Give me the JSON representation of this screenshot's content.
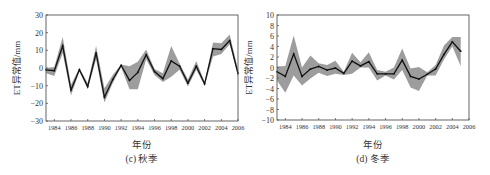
{
  "chart_data": [
    {
      "id": "c",
      "type": "line",
      "title": "(c) 秋季",
      "xlabel": "年份",
      "ylabel": "ET异常值/mm",
      "ylim": [
        -30,
        30
      ],
      "xlim": [
        1983,
        2006
      ],
      "yticks": [
        -30,
        -20,
        -10,
        0,
        10,
        20,
        30
      ],
      "xticks": [
        1984,
        1986,
        1988,
        1990,
        1992,
        1994,
        1996,
        1998,
        2000,
        2002,
        2004,
        2006
      ],
      "grid": false,
      "legend": null,
      "x": [
        1983,
        1984,
        1985,
        1986,
        1987,
        1988,
        1989,
        1990,
        1991,
        1992,
        1993,
        1994,
        1995,
        1996,
        1997,
        1998,
        1999,
        2000,
        2001,
        2002,
        2003,
        2004,
        2005,
        2006
      ],
      "series": [
        {
          "name": "mean",
          "values": [
            -1,
            -1.5,
            12.5,
            -12.5,
            -1,
            -10.5,
            8.5,
            -16.5,
            -6.5,
            1.5,
            -7,
            -2.5,
            7.5,
            -2,
            -6,
            4,
            1,
            -8.5,
            1,
            -9,
            11,
            10.5,
            15.5,
            -3
          ]
        },
        {
          "name": "upper",
          "values": [
            0,
            0.5,
            17.5,
            -9.5,
            0,
            -8.5,
            12.5,
            -11.5,
            -4,
            2,
            1,
            3.5,
            10.5,
            -0.5,
            -3,
            12.5,
            2.5,
            -6.5,
            4,
            -8,
            14.5,
            14,
            19,
            -1
          ]
        },
        {
          "name": "lower",
          "values": [
            -3,
            -4.5,
            8.5,
            -15.5,
            -2,
            -12,
            5,
            -19.5,
            -8.5,
            0.5,
            -12,
            -12,
            5,
            -4,
            -8,
            -5,
            -1,
            -10.5,
            -1,
            -10,
            6.5,
            8,
            13.5,
            -5
          ]
        }
      ]
    },
    {
      "id": "d",
      "type": "line",
      "title": "(d) 冬季",
      "xlabel": "年份",
      "ylabel": "ET异常值/mm",
      "ylim": [
        -10,
        10
      ],
      "xlim": [
        1983,
        2006
      ],
      "yticks": [
        -10,
        -8,
        -6,
        -4,
        -2,
        0,
        2,
        4,
        6,
        8,
        10
      ],
      "xticks": [
        1984,
        1986,
        1988,
        1990,
        1992,
        1994,
        1996,
        1998,
        2000,
        2002,
        2004,
        2006
      ],
      "grid": false,
      "legend": null,
      "x": [
        1983,
        1984,
        1985,
        1986,
        1987,
        1988,
        1989,
        1990,
        1991,
        1992,
        1993,
        1994,
        1995,
        1996,
        1997,
        1998,
        1999,
        2000,
        2001,
        2002,
        2003,
        2004,
        2005
      ],
      "series": [
        {
          "name": "mean",
          "values": [
            -0.8,
            -1.7,
            2.6,
            -1.7,
            -0.3,
            0.2,
            -0.5,
            -0.1,
            -1.1,
            1.2,
            0.3,
            1.1,
            -1.2,
            -1.2,
            -1.2,
            1.4,
            -1.7,
            -2.2,
            -1.3,
            -0.3,
            2.5,
            4.9,
            3.1
          ]
        },
        {
          "name": "upper",
          "values": [
            0.2,
            0.3,
            6.1,
            0,
            2.3,
            0.8,
            0.5,
            1.3,
            -0.8,
            2.8,
            1.0,
            2.9,
            -0.5,
            -0.8,
            0,
            3.6,
            -0.2,
            0.1,
            -0.9,
            0.5,
            4.2,
            5.8,
            5.8
          ]
        },
        {
          "name": "lower",
          "values": [
            -2.5,
            -4.8,
            -1.5,
            -3.4,
            -2.1,
            -1.0,
            -1.6,
            -1.2,
            -1.4,
            -1.2,
            0,
            0,
            -2.5,
            -1.5,
            -2.3,
            -0.5,
            -3.8,
            -4.5,
            -1.5,
            -1.5,
            1.5,
            4.0,
            0.3
          ]
        }
      ]
    }
  ],
  "panels": {
    "c": {
      "caption": "(c) 秋季",
      "xlabel": "年份",
      "ylabel": "ET异常值/mm"
    },
    "d": {
      "caption": "(d) 冬季",
      "xlabel": "年份",
      "ylabel": "ET异常值/mm"
    }
  },
  "colors": {
    "band": "#8c8c8c",
    "line": "#111111",
    "frame": "#555555"
  }
}
